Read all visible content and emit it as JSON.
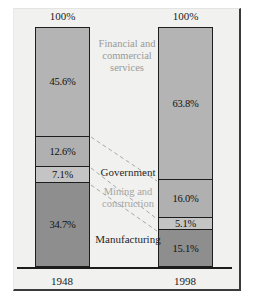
{
  "chart_data": {
    "type": "bar",
    "subtype": "stacked-percentage",
    "title": "",
    "xlabel": "",
    "ylabel": "",
    "ylim": [
      0,
      100
    ],
    "grid": false,
    "legend": "inline-annotations",
    "categories": [
      "1948",
      "1998"
    ],
    "totals": [
      "100%",
      "100%"
    ],
    "series": [
      {
        "name": "Financial and commercial services",
        "values": [
          45.6,
          63.8
        ],
        "labels": [
          "45.6%",
          "63.8%"
        ],
        "color": "#b4b4b4"
      },
      {
        "name": "Government",
        "values": [
          12.6,
          16.0
        ],
        "labels": [
          "12.6%",
          "16.0%"
        ],
        "color": "#b0b0b0"
      },
      {
        "name": "Mining and construction",
        "values": [
          7.1,
          5.1
        ],
        "labels": [
          "7.1%",
          "5.1%"
        ],
        "color": "#c2c2c2"
      },
      {
        "name": "Manufacturing",
        "values": [
          34.7,
          15.1
        ],
        "labels": [
          "34.7%",
          "15.1%"
        ],
        "color": "#8e8e8e"
      }
    ]
  },
  "bars": {
    "left": {
      "cap": "100%",
      "year": "1948",
      "segments": [
        {
          "label": "45.6%",
          "pct": 45.6,
          "color": "#b4b4b4"
        },
        {
          "label": "12.6%",
          "pct": 12.6,
          "color": "#b0b0b0"
        },
        {
          "label": "7.1%",
          "pct": 7.1,
          "color": "#c4c4c4"
        },
        {
          "label": "34.7%",
          "pct": 34.7,
          "color": "#8e8e8e"
        }
      ]
    },
    "right": {
      "cap": "100%",
      "year": "1998",
      "segments": [
        {
          "label": "63.8%",
          "pct": 63.8,
          "color": "#b4b4b4"
        },
        {
          "label": "16.0%",
          "pct": 16.0,
          "color": "#b0b0b0"
        },
        {
          "label": "5.1%",
          "pct": 5.1,
          "color": "#c4c4c4"
        },
        {
          "label": "15.1%",
          "pct": 15.1,
          "color": "#8e8e8e"
        }
      ]
    }
  },
  "annotations": {
    "financial": "Financial and\ncommercial\nservices",
    "government": "Government",
    "mining": "Mining and\nconstruction",
    "manufacturing": "Manufacturing"
  },
  "colors": {
    "panel_background": "#f1f1ef",
    "frame": "#3a3a3a",
    "bar_outline": "#1d1d1d",
    "connector": "#a9a9a7",
    "text": "#1a1a1a",
    "muted_text": "#9a9a98"
  }
}
